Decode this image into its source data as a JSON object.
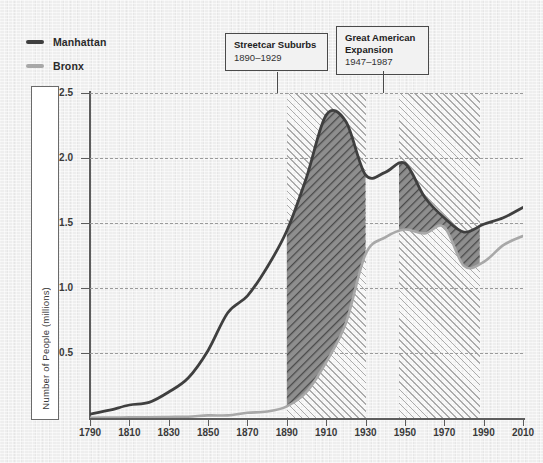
{
  "legend": {
    "items": [
      {
        "label": "Manhattan",
        "color": "#3f3f3f",
        "icon": "line-swatch"
      },
      {
        "label": "Bronx",
        "color": "#a8a8a8",
        "icon": "line-swatch"
      }
    ]
  },
  "annotations": [
    {
      "id": "streetcar",
      "title": "Streetcar Suburbs",
      "range": "1890–1929",
      "x_start": 1890,
      "x_end": 1930
    },
    {
      "id": "expansion",
      "title": "Great American",
      "title2": "Expansion",
      "range": "1947–1987",
      "x_start": 1947,
      "x_end": 1988
    }
  ],
  "chart_data": {
    "type": "area",
    "title": "",
    "xlabel": "",
    "ylabel": "Number of People (millions)",
    "xlim": [
      1790,
      2010
    ],
    "ylim": [
      0,
      2.5
    ],
    "xticks": [
      1790,
      1810,
      1830,
      1850,
      1870,
      1890,
      1910,
      1930,
      1950,
      1970,
      1990,
      2010
    ],
    "yticks": [
      0.5,
      1.0,
      1.5,
      2.0,
      2.5
    ],
    "ytick_labels": [
      "0.5",
      "1.0",
      "1.5",
      "2.0",
      "2.5"
    ],
    "grid": "horizontal-dashed",
    "legend_position": "top-left",
    "shaded_bands": [
      {
        "label": "Streetcar Suburbs",
        "from": 1890,
        "to": 1930,
        "style": "diagonal-hatch"
      },
      {
        "label": "Great American Expansion",
        "from": 1947,
        "to": 1988,
        "style": "diagonal-hatch"
      }
    ],
    "x": [
      1790,
      1800,
      1810,
      1820,
      1830,
      1840,
      1850,
      1860,
      1870,
      1880,
      1890,
      1900,
      1910,
      1920,
      1930,
      1940,
      1950,
      1960,
      1970,
      1980,
      1990,
      2000,
      2010
    ],
    "series": [
      {
        "name": "Manhattan",
        "color": "#3f3f3f",
        "values": [
          0.03,
          0.06,
          0.1,
          0.12,
          0.2,
          0.31,
          0.52,
          0.81,
          0.94,
          1.16,
          1.44,
          1.85,
          2.33,
          2.28,
          1.87,
          1.89,
          1.96,
          1.7,
          1.54,
          1.43,
          1.49,
          1.54,
          1.62
        ]
      },
      {
        "name": "Bronx",
        "color": "#a8a8a8",
        "values": [
          0.002,
          0.003,
          0.005,
          0.006,
          0.008,
          0.01,
          0.02,
          0.02,
          0.04,
          0.05,
          0.09,
          0.2,
          0.43,
          0.73,
          1.26,
          1.39,
          1.45,
          1.42,
          1.47,
          1.17,
          1.2,
          1.33,
          1.4
        ]
      }
    ]
  }
}
